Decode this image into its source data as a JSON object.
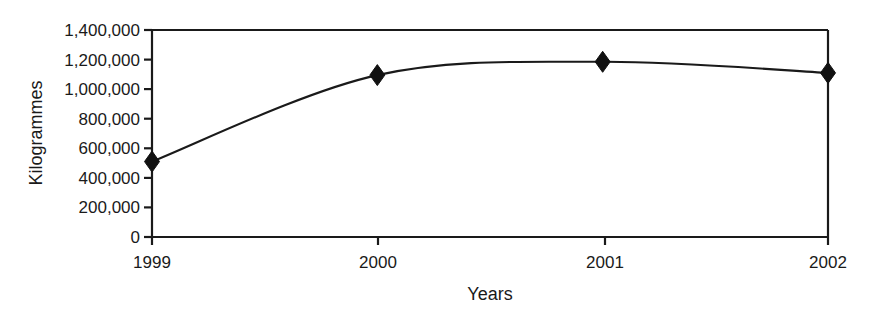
{
  "chart_data": {
    "type": "line",
    "title": "",
    "subtitle": "",
    "xlabel": "Years",
    "ylabel": "Kilogrammes",
    "x": [
      "1999",
      "2000",
      "2001",
      "2002"
    ],
    "categories": [
      "1999",
      "2000",
      "2001",
      "2002"
    ],
    "values": [
      510000,
      1095000,
      1185000,
      1110000
    ],
    "series": [
      {
        "name": "Kilogrammes",
        "values": [
          510000,
          1095000,
          1185000,
          1110000
        ]
      }
    ],
    "ylim": [
      0,
      1400000
    ],
    "yticks": [
      0,
      200000,
      400000,
      600000,
      800000,
      1000000,
      1200000,
      1400000
    ],
    "ytick_labels": [
      "0",
      "200,000",
      "400,000",
      "600,000",
      "800,000",
      "1,000,000",
      "1,200,000",
      "1,400,000"
    ],
    "xtick_labels": [
      "1999",
      "2000",
      "2001",
      "2002"
    ],
    "grid": false,
    "legend": null,
    "legend_position": "none",
    "marker": "diamond",
    "line_color": "#1a1a1a",
    "marker_color": "#111111",
    "smoothed": true,
    "annotations": []
  },
  "axes": {
    "y_title": "Kilogrammes",
    "x_title": "Years",
    "y_labels": [
      "1,400,000",
      "1,200,000",
      "1,000,000",
      "800,000",
      "600,000",
      "400,000",
      "200,000",
      "0"
    ],
    "x_labels": [
      "1999",
      "2000",
      "2001",
      "2002"
    ]
  }
}
